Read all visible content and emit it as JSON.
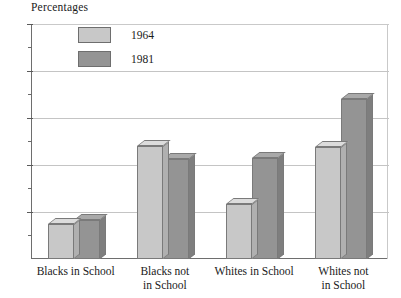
{
  "chart_data": {
    "type": "bar",
    "title": "Percentages",
    "xlabel": "",
    "ylabel": "Percentages",
    "ylim": [
      0,
      100
    ],
    "ytick_labels": [
      "20",
      "40",
      "60",
      "80",
      "100"
    ],
    "ytick_values": [
      20,
      40,
      60,
      80,
      100
    ],
    "yminor_values": [
      10,
      30,
      50,
      70,
      90
    ],
    "grid": true,
    "legend_position": "top-left-inside",
    "categories": [
      "Blacks in School",
      "Blacks not in School",
      "Whites in School",
      "Whites not in School"
    ],
    "category_lines": [
      [
        "Blacks in School"
      ],
      [
        "Blacks not",
        "in School"
      ],
      [
        "Whites in School"
      ],
      [
        "Whites not",
        "in School"
      ]
    ],
    "series": [
      {
        "name": "1964",
        "color": "#c8c8c8",
        "values": [
          15,
          48,
          23.5,
          47.5
        ]
      },
      {
        "name": "1981",
        "color": "#949494",
        "values": [
          16.5,
          42.5,
          43,
          68
        ]
      }
    ]
  },
  "colors": {
    "series_1964": "#c8c8c8",
    "series_1964_side": "#b0b0b0",
    "series_1964_top": "#dcdcdc",
    "series_1981": "#949494",
    "series_1981_side": "#7e7e7e",
    "series_1981_top": "#a9a9a9",
    "axis": "#6e6e6e",
    "grid": "#c4c4c4",
    "text": "#1a1a1a",
    "background": "#ffffff"
  }
}
